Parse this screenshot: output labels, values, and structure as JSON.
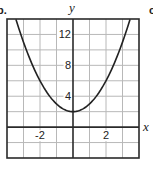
{
  "panel_label": "b.",
  "next_panel_fragment": "c",
  "chart_data": {
    "type": "line",
    "title": "",
    "xlabel": "x",
    "ylabel": "y",
    "function": "y = x^2 + 2",
    "xlim": [
      -4,
      4
    ],
    "ylim": [
      -4,
      14
    ],
    "grid": true,
    "grid_step_x": 1,
    "grid_step_y": 2,
    "x_tick_labels": [
      {
        "value": -2,
        "label": "-2"
      },
      {
        "value": 2,
        "label": "2"
      }
    ],
    "y_tick_labels": [
      {
        "value": 4,
        "label": "4"
      },
      {
        "value": 8,
        "label": "8"
      },
      {
        "value": 12,
        "label": "12"
      }
    ],
    "series": [
      {
        "name": "parabola",
        "x": [
          -3.46,
          -3,
          -2.5,
          -2,
          -1.5,
          -1,
          -0.5,
          0,
          0.5,
          1,
          1.5,
          2,
          2.5,
          3,
          3.46
        ],
        "y": [
          14,
          11,
          8.25,
          6,
          4.25,
          3,
          2.25,
          2,
          2.25,
          3,
          4.25,
          6,
          8.25,
          11,
          14
        ]
      }
    ],
    "vertex": {
      "x": 0,
      "y": 2
    },
    "colors": {
      "curve": "#222222",
      "grid": "#b8b8b8",
      "axis": "#2a2a2a"
    }
  }
}
